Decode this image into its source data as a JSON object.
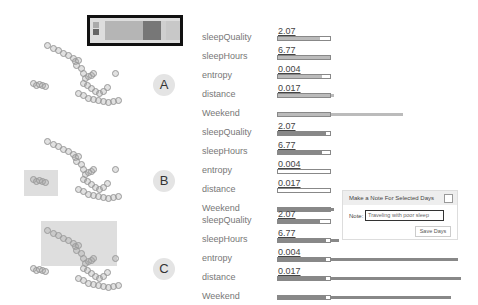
{
  "legend": {
    "swatches": [
      "#aaaaaa",
      "#666666",
      "#dddddd"
    ],
    "segments": [
      {
        "left": 15,
        "width": 38,
        "color": "#b5b5b5"
      },
      {
        "left": 53,
        "width": 18,
        "color": "#777777"
      },
      {
        "left": 71,
        "width": 5,
        "color": "#cfcfcf"
      },
      {
        "left": 76,
        "width": 14,
        "color": "#c8c8c8"
      }
    ]
  },
  "panels": [
    {
      "label": "A",
      "top": 27
    },
    {
      "label": "B",
      "top": 123
    },
    {
      "label": "C",
      "top": 211
    }
  ],
  "attributes": [
    "sleepQuality",
    "sleepHours",
    "entropy",
    "distance",
    "Weekend"
  ],
  "groups": [
    {
      "label": "A",
      "rows": [
        {
          "attr": "sleepQuality",
          "value": "2.07",
          "fill": 42,
          "fill_color": "#bbbbbb",
          "ext": 0
        },
        {
          "attr": "sleepHours",
          "value": "6.77",
          "fill": 52,
          "fill_color": "#bbbbbb",
          "ext": 0
        },
        {
          "attr": "entropy",
          "value": "0.004",
          "fill": 44,
          "fill_color": "#bbbbbb",
          "ext": 0
        },
        {
          "attr": "distance",
          "value": "0.017",
          "fill": 52,
          "fill_color": "#bbbbbb",
          "ext": 3
        },
        {
          "attr": "Weekend",
          "value": "",
          "fill": 52,
          "fill_color": "#bbbbbb",
          "ext": 72
        }
      ]
    },
    {
      "label": "B",
      "rows": [
        {
          "attr": "sleepQuality",
          "value": "2.07",
          "fill": 48,
          "fill_color": "#888888",
          "ext": 0
        },
        {
          "attr": "sleepHours",
          "value": "6.77",
          "fill": 44,
          "fill_color": "#888888",
          "ext": 0
        },
        {
          "attr": "entropy",
          "value": "0.004",
          "fill": 0,
          "fill_color": "#888888",
          "ext": 0
        },
        {
          "attr": "distance",
          "value": "0.017",
          "fill": 0,
          "fill_color": "#888888",
          "ext": 0
        },
        {
          "attr": "Weekend",
          "value": "",
          "fill": 52,
          "fill_color": "#888888",
          "ext": 3
        }
      ]
    },
    {
      "label": "C",
      "rows": [
        {
          "attr": "sleepQuality",
          "value": "2.07",
          "fill": 42,
          "fill_color": "#888888",
          "ext": 0
        },
        {
          "attr": "sleepHours",
          "value": "6.77",
          "fill": 48,
          "fill_color": "#888888",
          "ext": 8
        },
        {
          "attr": "entropy",
          "value": "0.004",
          "fill": 48,
          "fill_color": "#888888",
          "ext": 127
        },
        {
          "attr": "distance",
          "value": "0.017",
          "fill": 48,
          "fill_color": "#888888",
          "ext": 130
        },
        {
          "attr": "Weekend",
          "value": "",
          "fill": 48,
          "fill_color": "#888888",
          "ext": 120
        }
      ]
    }
  ],
  "note_panel": {
    "title": "Make a Note For Selected Days",
    "note_label": "Note:",
    "note_value": "Traveling with poor sleep",
    "save_label": "Save Days"
  }
}
